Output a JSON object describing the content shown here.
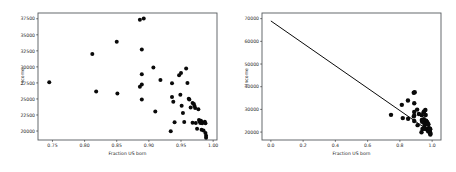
{
  "figure": {
    "background_color": "#ffffff",
    "point_color": "#0a0a0a",
    "line_color": "#0a0a0a",
    "spine_color": "#555a5e",
    "panel_count": 2
  },
  "chart_data": [
    {
      "type": "scatter",
      "panel": "left",
      "title": "",
      "xlabel": "Fraction US born",
      "ylabel": "Income",
      "xlim": [
        0.7275,
        1.006
      ],
      "ylim": [
        18600,
        38400
      ],
      "xticks": [
        0.75,
        0.8,
        0.85,
        0.9,
        0.95,
        1.0
      ],
      "xticklabels": [
        "0.75",
        "0.80",
        "0.85",
        "0.90",
        "0.95",
        "1.00"
      ],
      "yticks": [
        20000,
        22500,
        25000,
        27500,
        30000,
        32500,
        35000,
        37500
      ],
      "yticklabels": [
        "20000",
        "22500",
        "25000",
        "27500",
        "30000",
        "32500",
        "35000",
        "37500"
      ],
      "grid": false,
      "legend": false,
      "marker": "circle",
      "marker_size": 2.0,
      "points": [
        [
          0.745,
          27600
        ],
        [
          0.812,
          32000
        ],
        [
          0.818,
          26150
        ],
        [
          0.85,
          33900
        ],
        [
          0.851,
          25850
        ],
        [
          0.886,
          37350
        ],
        [
          0.889,
          32700
        ],
        [
          0.892,
          37550
        ],
        [
          0.889,
          28850
        ],
        [
          0.889,
          27250
        ],
        [
          0.886,
          26900
        ],
        [
          0.889,
          24900
        ],
        [
          0.907,
          29900
        ],
        [
          0.91,
          23050
        ],
        [
          0.918,
          27950
        ],
        [
          0.934,
          19950
        ],
        [
          0.936,
          27450
        ],
        [
          0.936,
          25300
        ],
        [
          0.938,
          24550
        ],
        [
          0.94,
          21350
        ],
        [
          0.947,
          28700
        ],
        [
          0.95,
          29050
        ],
        [
          0.949,
          25650
        ],
        [
          0.951,
          23950
        ],
        [
          0.953,
          22800
        ],
        [
          0.955,
          21400
        ],
        [
          0.958,
          29750
        ],
        [
          0.96,
          27500
        ],
        [
          0.962,
          25050
        ],
        [
          0.963,
          24900
        ],
        [
          0.965,
          23650
        ],
        [
          0.968,
          24350
        ],
        [
          0.97,
          24200
        ],
        [
          0.971,
          23900
        ],
        [
          0.972,
          23600
        ],
        [
          0.968,
          21300
        ],
        [
          0.973,
          21250
        ],
        [
          0.975,
          20350
        ],
        [
          0.977,
          23400
        ],
        [
          0.978,
          21700
        ],
        [
          0.979,
          21500
        ],
        [
          0.98,
          21250
        ],
        [
          0.981,
          21600
        ],
        [
          0.982,
          21400
        ],
        [
          0.983,
          21200
        ],
        [
          0.982,
          20200
        ],
        [
          0.985,
          20100
        ],
        [
          0.987,
          21450
        ],
        [
          0.988,
          21200
        ],
        [
          0.988,
          19700
        ],
        [
          0.989,
          19250
        ],
        [
          0.989,
          18950
        ]
      ]
    },
    {
      "type": "scatter",
      "panel": "right",
      "title": "",
      "xlabel": "Fraction US born",
      "ylabel": "Income",
      "xlim": [
        -0.055,
        1.055
      ],
      "ylim": [
        16500,
        72500
      ],
      "xticks": [
        0.0,
        0.2,
        0.4,
        0.6,
        0.8,
        1.0
      ],
      "xticklabels": [
        "0.0",
        "0.2",
        "0.4",
        "0.6",
        "0.8",
        "1.0"
      ],
      "yticks": [
        20000,
        30000,
        40000,
        50000,
        60000,
        70000
      ],
      "yticklabels": [
        "20000",
        "30000",
        "40000",
        "50000",
        "60000",
        "70000"
      ],
      "grid": false,
      "legend": false,
      "marker": "circle",
      "marker_size": 2.2,
      "fit_line": {
        "label": "linear fit",
        "x_start": 0.0,
        "y_start": 69000,
        "x_end": 1.0,
        "y_end": 19600
      },
      "points": [
        [
          0.745,
          27600
        ],
        [
          0.812,
          32000
        ],
        [
          0.818,
          26150
        ],
        [
          0.85,
          33900
        ],
        [
          0.851,
          25850
        ],
        [
          0.886,
          37350
        ],
        [
          0.889,
          32700
        ],
        [
          0.892,
          37550
        ],
        [
          0.889,
          28850
        ],
        [
          0.889,
          27250
        ],
        [
          0.886,
          26900
        ],
        [
          0.889,
          24900
        ],
        [
          0.907,
          29900
        ],
        [
          0.91,
          23050
        ],
        [
          0.918,
          27950
        ],
        [
          0.934,
          19950
        ],
        [
          0.936,
          27450
        ],
        [
          0.936,
          25300
        ],
        [
          0.938,
          24550
        ],
        [
          0.94,
          21350
        ],
        [
          0.947,
          28700
        ],
        [
          0.95,
          29050
        ],
        [
          0.949,
          25650
        ],
        [
          0.951,
          23950
        ],
        [
          0.953,
          22800
        ],
        [
          0.955,
          21400
        ],
        [
          0.958,
          29750
        ],
        [
          0.96,
          27500
        ],
        [
          0.962,
          25050
        ],
        [
          0.963,
          24900
        ],
        [
          0.965,
          23650
        ],
        [
          0.968,
          24350
        ],
        [
          0.97,
          24200
        ],
        [
          0.971,
          23900
        ],
        [
          0.972,
          23600
        ],
        [
          0.968,
          21300
        ],
        [
          0.973,
          21250
        ],
        [
          0.975,
          20350
        ],
        [
          0.977,
          23400
        ],
        [
          0.978,
          21700
        ],
        [
          0.979,
          21500
        ],
        [
          0.98,
          21250
        ],
        [
          0.981,
          21600
        ],
        [
          0.982,
          21400
        ],
        [
          0.983,
          21200
        ],
        [
          0.982,
          20200
        ],
        [
          0.985,
          20100
        ],
        [
          0.987,
          21450
        ],
        [
          0.988,
          21200
        ],
        [
          0.988,
          19700
        ],
        [
          0.989,
          19250
        ],
        [
          0.989,
          18950
        ]
      ]
    }
  ]
}
